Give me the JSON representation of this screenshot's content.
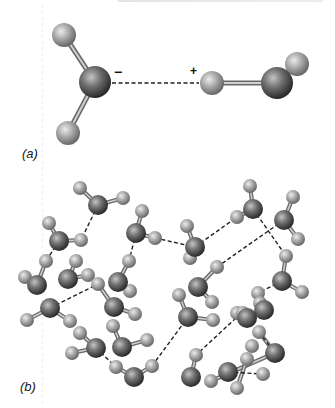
{
  "figure": {
    "colors": {
      "oxygen": "#6e6e6e",
      "oxygen_highlight": "#b4b4b4",
      "oxygen_edge": "#2e2e2e",
      "hydrogen": "#a8a8a8",
      "hydrogen_highlight": "#e2e2e2",
      "hydrogen_edge": "#6c6c6c",
      "bond": "#9a9a9a",
      "hbond": "#222222"
    },
    "panel_a": {
      "label": "(a)",
      "negative_charge": "−",
      "positive_charge": "+",
      "atoms": [
        {
          "el": "H",
          "x": 64,
          "y": 35,
          "r": 12
        },
        {
          "el": "H",
          "x": 68,
          "y": 133,
          "r": 12
        },
        {
          "el": "O",
          "x": 95,
          "y": 82,
          "r": 16
        },
        {
          "el": "H",
          "x": 297,
          "y": 64,
          "r": 12
        },
        {
          "el": "O",
          "x": 277,
          "y": 83,
          "r": 16
        },
        {
          "el": "H",
          "x": 212,
          "y": 83,
          "r": 12
        }
      ],
      "bonds": [
        [
          0,
          2
        ],
        [
          1,
          2
        ],
        [
          3,
          4
        ],
        [
          4,
          5
        ]
      ],
      "hbonds": [
        {
          "x1": 112,
          "y1": 83,
          "x2": 199,
          "y2": 83
        }
      ]
    },
    "panel_b": {
      "label": "(b)",
      "atoms": [
        {
          "el": "H",
          "x": 80,
          "y": 188
        },
        {
          "el": "H",
          "x": 123,
          "y": 198
        },
        {
          "el": "O",
          "x": 98,
          "y": 205
        },
        {
          "el": "H",
          "x": 49,
          "y": 223
        },
        {
          "el": "H",
          "x": 81,
          "y": 240
        },
        {
          "el": "O",
          "x": 59,
          "y": 241
        },
        {
          "el": "H",
          "x": 142,
          "y": 211
        },
        {
          "el": "H",
          "x": 155,
          "y": 238
        },
        {
          "el": "O",
          "x": 136,
          "y": 233
        },
        {
          "el": "H",
          "x": 46,
          "y": 261
        },
        {
          "el": "H",
          "x": 25,
          "y": 277
        },
        {
          "el": "O",
          "x": 37,
          "y": 285
        },
        {
          "el": "H",
          "x": 76,
          "y": 261
        },
        {
          "el": "H",
          "x": 88,
          "y": 275
        },
        {
          "el": "O",
          "x": 68,
          "y": 279
        },
        {
          "el": "H",
          "x": 129,
          "y": 261
        },
        {
          "el": "H",
          "x": 130,
          "y": 291
        },
        {
          "el": "O",
          "x": 118,
          "y": 282
        },
        {
          "el": "H",
          "x": 250,
          "y": 186
        },
        {
          "el": "H",
          "x": 237,
          "y": 217
        },
        {
          "el": "O",
          "x": 253,
          "y": 209
        },
        {
          "el": "H",
          "x": 187,
          "y": 226
        },
        {
          "el": "H",
          "x": 190,
          "y": 258
        },
        {
          "el": "O",
          "x": 195,
          "y": 247
        },
        {
          "el": "H",
          "x": 293,
          "y": 197
        },
        {
          "el": "H",
          "x": 298,
          "y": 239
        },
        {
          "el": "O",
          "x": 284,
          "y": 220
        },
        {
          "el": "H",
          "x": 286,
          "y": 256
        },
        {
          "el": "H",
          "x": 302,
          "y": 292
        },
        {
          "el": "O",
          "x": 282,
          "y": 281
        },
        {
          "el": "H",
          "x": 217,
          "y": 267
        },
        {
          "el": "H",
          "x": 212,
          "y": 302
        },
        {
          "el": "O",
          "x": 198,
          "y": 287
        },
        {
          "el": "H",
          "x": 98,
          "y": 284
        },
        {
          "el": "H",
          "x": 135,
          "y": 314
        },
        {
          "el": "O",
          "x": 114,
          "y": 307
        },
        {
          "el": "H",
          "x": 27,
          "y": 320
        },
        {
          "el": "H",
          "x": 70,
          "y": 321
        },
        {
          "el": "O",
          "x": 50,
          "y": 308
        },
        {
          "el": "H",
          "x": 80,
          "y": 333
        },
        {
          "el": "H",
          "x": 72,
          "y": 353
        },
        {
          "el": "O",
          "x": 96,
          "y": 348
        },
        {
          "el": "H",
          "x": 113,
          "y": 326
        },
        {
          "el": "H",
          "x": 147,
          "y": 340
        },
        {
          "el": "O",
          "x": 122,
          "y": 347
        },
        {
          "el": "H",
          "x": 116,
          "y": 367
        },
        {
          "el": "H",
          "x": 152,
          "y": 366
        },
        {
          "el": "O",
          "x": 134,
          "y": 377
        },
        {
          "el": "H",
          "x": 179,
          "y": 295
        },
        {
          "el": "H",
          "x": 213,
          "y": 320
        },
        {
          "el": "O",
          "x": 188,
          "y": 317
        },
        {
          "el": "H",
          "x": 258,
          "y": 293
        },
        {
          "el": "H",
          "x": 260,
          "y": 303
        },
        {
          "el": "O",
          "x": 264,
          "y": 310
        },
        {
          "el": "H",
          "x": 237,
          "y": 313
        },
        {
          "el": "H",
          "x": 243,
          "y": 313
        },
        {
          "el": "O",
          "x": 247,
          "y": 318
        },
        {
          "el": "H",
          "x": 259,
          "y": 332
        },
        {
          "el": "H",
          "x": 252,
          "y": 346
        },
        {
          "el": "O",
          "x": 275,
          "y": 353
        },
        {
          "el": "H",
          "x": 196,
          "y": 355
        },
        {
          "el": "H",
          "x": 211,
          "y": 381
        },
        {
          "el": "O",
          "x": 191,
          "y": 377
        },
        {
          "el": "H",
          "x": 247,
          "y": 359
        },
        {
          "el": "H",
          "x": 237,
          "y": 388
        },
        {
          "el": "H",
          "x": 263,
          "y": 374
        },
        {
          "el": "O",
          "x": 228,
          "y": 372
        }
      ],
      "bonds": [
        [
          0,
          2
        ],
        [
          1,
          2
        ],
        [
          3,
          5
        ],
        [
          4,
          5
        ],
        [
          6,
          8
        ],
        [
          7,
          8
        ],
        [
          9,
          11
        ],
        [
          10,
          11
        ],
        [
          12,
          14
        ],
        [
          13,
          14
        ],
        [
          15,
          17
        ],
        [
          16,
          17
        ],
        [
          18,
          20
        ],
        [
          19,
          20
        ],
        [
          21,
          23
        ],
        [
          22,
          23
        ],
        [
          24,
          26
        ],
        [
          25,
          26
        ],
        [
          27,
          29
        ],
        [
          28,
          29
        ],
        [
          30,
          32
        ],
        [
          31,
          32
        ],
        [
          33,
          35
        ],
        [
          34,
          35
        ],
        [
          36,
          38
        ],
        [
          37,
          38
        ],
        [
          39,
          41
        ],
        [
          40,
          41
        ],
        [
          42,
          44
        ],
        [
          43,
          44
        ],
        [
          45,
          47
        ],
        [
          46,
          47
        ],
        [
          48,
          50
        ],
        [
          49,
          50
        ],
        [
          51,
          53
        ],
        [
          52,
          53
        ],
        [
          54,
          56
        ],
        [
          55,
          56
        ],
        [
          57,
          59
        ],
        [
          61,
          59
        ],
        [
          60,
          62
        ],
        [
          63,
          64
        ],
        [
          65,
          68
        ],
        [
          66,
          68
        ],
        [
          67,
          59
        ]
      ],
      "hbonds": [
        [
          98,
          205,
          81,
          240
        ],
        [
          59,
          241,
          46,
          261
        ],
        [
          155,
          238,
          195,
          247
        ],
        [
          136,
          233,
          129,
          261
        ],
        [
          195,
          247,
          237,
          217
        ],
        [
          253,
          209,
          286,
          256
        ],
        [
          284,
          220,
          217,
          267
        ],
        [
          50,
          308,
          98,
          284
        ],
        [
          152,
          366,
          188,
          317
        ],
        [
          236,
          318,
          196,
          355
        ],
        [
          96,
          348,
          116,
          367
        ],
        [
          282,
          281,
          258,
          293
        ],
        [
          228,
          372,
          263,
          374
        ],
        [
          259,
          332,
          275,
          353
        ]
      ]
    }
  }
}
